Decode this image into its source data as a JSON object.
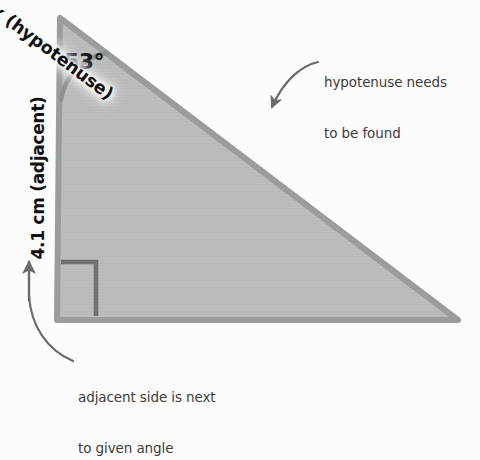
{
  "figure": {
    "background_color": "#fcfcfc",
    "fill_color": "#b9bbba",
    "stroke_color": "#9b9d9c",
    "right_angle_color": "#6f7170",
    "arrow_color": "#6b6b6b",
    "text_color": "#3c3c3c",
    "label_color": "#111111"
  },
  "angle": {
    "value_label": "53°",
    "degrees": 53
  },
  "sides": {
    "adjacent_label": "4.1 cm (adjacent)",
    "adjacent_length": "4.1 cm",
    "hypotenuse_label": "x (hypotenuse)",
    "hypotenuse_variable": "x"
  },
  "annotations": {
    "hypotenuse_note_line1": "hypotenuse needs",
    "hypotenuse_note_line2": "to be found",
    "adjacent_note_line1": "adjacent side is next",
    "adjacent_note_line2": "to given angle"
  },
  "markers": {
    "right_angle": "right-angle-square"
  }
}
